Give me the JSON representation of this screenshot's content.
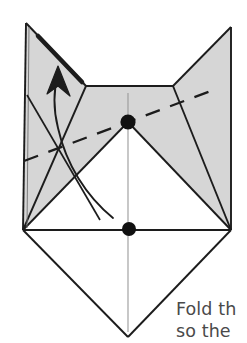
{
  "figure": {
    "kind": "origami-fold-diagram",
    "background_color": "#ffffff",
    "paper_front_color": "#d6d6d6",
    "paper_back_color": "#ffffff",
    "line_color": "#1c1c1c",
    "dash_fold_color": "#1c1c1c",
    "dot_color": "#111111",
    "center_line_color": "#8e8e8e"
  },
  "caption": {
    "line1": "Fold th",
    "line2": "so the",
    "text_color": "#4a4a4a"
  },
  "annotations": {
    "reference_dot_upper": "reference-point-upper",
    "reference_dot_lower": "reference-point-lower",
    "valley_fold_label": "valley-fold-dashed-line",
    "arrow_label": "fold-direction-arrow",
    "center_axis_label": "vertical-center-axis"
  },
  "geometry": {
    "ear_left_tip": [
      26,
      23
    ],
    "ear_right_tip": [
      231,
      27
    ],
    "top_edge_left": [
      86,
      86
    ],
    "top_edge_right": [
      173,
      86
    ],
    "corner_left": [
      23,
      230
    ],
    "corner_right": [
      231,
      230
    ],
    "chin_bottom": [
      128,
      337
    ],
    "dot_upper": [
      128,
      122
    ],
    "dot_lower": [
      129,
      229
    ],
    "dash_start": [
      24,
      161
    ],
    "dash_end": [
      216,
      89
    ]
  }
}
